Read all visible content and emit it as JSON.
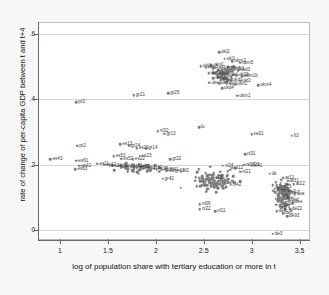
{
  "chart_data": {
    "type": "scatter",
    "title": "",
    "xlabel": "log of population share with tertiary education or more in t",
    "ylabel": "rate of change of per-capita GDP between t and t+4",
    "xlim": [
      0.78,
      3.62
    ],
    "ylim": [
      -0.035,
      0.635
    ],
    "xticks": [
      "1",
      "1.5",
      "2",
      "2.5",
      "3",
      "3.5"
    ],
    "xtickvals": [
      1,
      1.5,
      2,
      2.5,
      3,
      3.5
    ],
    "yticks": [
      "0",
      ".2",
      ".4",
      ".6"
    ],
    "ytickvals": [
      0,
      0.2,
      0.4,
      0.6
    ],
    "grid": "horizontal",
    "legend": "none",
    "marker_color": "#7d7d7d",
    "points": [
      {
        "label": "ukl2",
        "x": 2.66,
        "y": 0.545
      },
      {
        "label": "ukl1",
        "x": 2.72,
        "y": 0.525
      },
      {
        "label": "ukm2",
        "x": 2.8,
        "y": 0.518
      },
      {
        "label": "ukm5",
        "x": 2.88,
        "y": 0.513
      },
      {
        "label": "ukn0",
        "x": 2.58,
        "y": 0.505
      },
      {
        "label": "ukj1",
        "x": 2.47,
        "y": 0.502
      },
      {
        "label": "uke3",
        "x": 2.52,
        "y": 0.5
      },
      {
        "label": "ukf1",
        "x": 2.62,
        "y": 0.498
      },
      {
        "label": "ukg2",
        "x": 2.7,
        "y": 0.497
      },
      {
        "label": "ukh3",
        "x": 2.76,
        "y": 0.495
      },
      {
        "label": "uki1",
        "x": 2.82,
        "y": 0.493
      },
      {
        "label": "ukd3",
        "x": 2.86,
        "y": 0.49
      },
      {
        "label": "ukc2",
        "x": 2.55,
        "y": 0.481
      },
      {
        "label": "uke4",
        "x": 2.64,
        "y": 0.478
      },
      {
        "label": "ukk1",
        "x": 2.74,
        "y": 0.476
      },
      {
        "label": "ukl2b",
        "x": 2.84,
        "y": 0.474
      },
      {
        "label": "ukm1b",
        "x": 2.9,
        "y": 0.472
      },
      {
        "label": "ukg1",
        "x": 2.6,
        "y": 0.466
      },
      {
        "label": "ukj3",
        "x": 2.68,
        "y": 0.463
      },
      {
        "label": "ukd1",
        "x": 2.78,
        "y": 0.46
      },
      {
        "label": "ukf2",
        "x": 2.88,
        "y": 0.458
      },
      {
        "label": "uke2",
        "x": 2.56,
        "y": 0.452
      },
      {
        "label": "ukh1",
        "x": 2.66,
        "y": 0.45
      },
      {
        "label": "uki2",
        "x": 2.74,
        "y": 0.448
      },
      {
        "label": "ukn1",
        "x": 2.83,
        "y": 0.446
      },
      {
        "label": "ukd4",
        "x": 2.69,
        "y": 0.434
      },
      {
        "label": "ukm4",
        "x": 3.07,
        "y": 0.443
      },
      {
        "label": "ukm1",
        "x": 2.85,
        "y": 0.412
      },
      {
        "label": "gr21",
        "x": 1.77,
        "y": 0.413
      },
      {
        "label": "gr25",
        "x": 2.13,
        "y": 0.419
      },
      {
        "label": "pt3",
        "x": 1.17,
        "y": 0.392
      },
      {
        "label": "lu",
        "x": 2.45,
        "y": 0.314
      },
      {
        "label": "nl32",
        "x": 2.02,
        "y": 0.303
      },
      {
        "label": "gr13",
        "x": 2.09,
        "y": 0.295
      },
      {
        "label": "se01",
        "x": 3.0,
        "y": 0.293
      },
      {
        "label": "fi2",
        "x": 3.42,
        "y": 0.288
      },
      {
        "label": "pt2",
        "x": 1.18,
        "y": 0.258
      },
      {
        "label": "es13",
        "x": 1.63,
        "y": 0.263
      },
      {
        "label": "gr24",
        "x": 1.72,
        "y": 0.258
      },
      {
        "label": "es21",
        "x": 1.8,
        "y": 0.25
      },
      {
        "label": "gr14",
        "x": 1.9,
        "y": 0.251
      },
      {
        "label": "es43",
        "x": 0.9,
        "y": 0.217
      },
      {
        "label": "es53",
        "x": 1.56,
        "y": 0.225
      },
      {
        "label": "es23",
        "x": 1.83,
        "y": 0.227
      },
      {
        "label": "es61",
        "x": 1.17,
        "y": 0.212
      },
      {
        "label": "es52",
        "x": 1.64,
        "y": 0.218
      },
      {
        "label": "es22",
        "x": 1.76,
        "y": 0.217
      },
      {
        "label": "nl31",
        "x": 2.93,
        "y": 0.232
      },
      {
        "label": "gr22",
        "x": 2.15,
        "y": 0.216
      },
      {
        "label": "es42",
        "x": 1.2,
        "y": 0.196
      },
      {
        "label": "es63",
        "x": 1.16,
        "y": 0.185
      },
      {
        "label": "es11",
        "x": 1.39,
        "y": 0.203
      },
      {
        "label": "es12",
        "x": 1.46,
        "y": 0.199
      },
      {
        "label": "es24",
        "x": 1.52,
        "y": 0.197
      },
      {
        "label": "es30",
        "x": 1.58,
        "y": 0.196
      },
      {
        "label": "es41",
        "x": 1.66,
        "y": 0.195
      },
      {
        "label": "es51",
        "x": 1.74,
        "y": 0.194
      },
      {
        "label": "es62",
        "x": 1.81,
        "y": 0.193
      },
      {
        "label": "gr11",
        "x": 1.88,
        "y": 0.19
      },
      {
        "label": "gr12",
        "x": 1.95,
        "y": 0.188
      },
      {
        "label": "gr23",
        "x": 2.01,
        "y": 0.186
      },
      {
        "label": "gr30",
        "x": 2.07,
        "y": 0.184
      },
      {
        "label": "gr41",
        "x": 2.12,
        "y": 0.183
      },
      {
        "label": "gr43",
        "x": 2.18,
        "y": 0.181
      },
      {
        "label": "itf2",
        "x": 2.26,
        "y": 0.18
      },
      {
        "label": "gr42",
        "x": 2.07,
        "y": 0.156
      },
      {
        "label": "nl06",
        "x": 2.46,
        "y": 0.078
      },
      {
        "label": "nl22",
        "x": 2.46,
        "y": 0.062
      },
      {
        "label": "nl11",
        "x": 2.62,
        "y": 0.056
      },
      {
        "label": "nl21",
        "x": 2.88,
        "y": 0.178
      },
      {
        "label": "nl12",
        "x": 2.8,
        "y": 0.19
      },
      {
        "label": "nl24",
        "x": 2.7,
        "y": 0.196
      },
      {
        "label": "nl13",
        "x": 2.92,
        "y": 0.2
      },
      {
        "label": "nl23",
        "x": 2.97,
        "y": 0.199
      },
      {
        "label": "nl41",
        "x": 3.0,
        "y": 0.197
      },
      {
        "label": "nl42",
        "x": 2.78,
        "y": 0.138
      },
      {
        "label": "it72",
        "x": 2.6,
        "y": 0.158
      },
      {
        "label": "dk",
        "x": 3.19,
        "y": 0.172
      },
      {
        "label": "at12",
        "x": 3.33,
        "y": 0.16
      },
      {
        "label": "at31",
        "x": 3.38,
        "y": 0.15
      },
      {
        "label": "at22",
        "x": 3.44,
        "y": 0.139
      },
      {
        "label": "at13",
        "x": 3.3,
        "y": 0.13
      },
      {
        "label": "at21",
        "x": 3.24,
        "y": 0.126
      },
      {
        "label": "de1",
        "x": 3.3,
        "y": 0.12
      },
      {
        "label": "de2",
        "x": 3.36,
        "y": 0.116
      },
      {
        "label": "de7",
        "x": 3.4,
        "y": 0.112
      },
      {
        "label": "dea",
        "x": 3.45,
        "y": 0.109
      },
      {
        "label": "deb",
        "x": 3.28,
        "y": 0.102
      },
      {
        "label": "dec",
        "x": 3.34,
        "y": 0.096
      },
      {
        "label": "ded",
        "x": 3.39,
        "y": 0.09
      },
      {
        "label": "dee",
        "x": 3.43,
        "y": 0.085
      },
      {
        "label": "def",
        "x": 3.36,
        "y": 0.078
      },
      {
        "label": "deg",
        "x": 3.3,
        "y": 0.072
      },
      {
        "label": "de22",
        "x": 3.4,
        "y": 0.062
      },
      {
        "label": "de5",
        "x": 3.33,
        "y": 0.05
      },
      {
        "label": "de6",
        "x": 3.26,
        "y": 0.056
      },
      {
        "label": "de93",
        "x": 3.37,
        "y": 0.041
      },
      {
        "label": "de3",
        "x": 3.22,
        "y": -0.012
      }
    ],
    "cluster_counts": {
      "uk_cluster": 60,
      "center_band": 120,
      "de_at_cluster": 95,
      "es_gr_band": 55
    }
  }
}
